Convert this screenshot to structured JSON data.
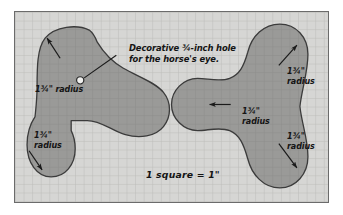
{
  "figure": {
    "background_color": "#d6d6d4",
    "grid_line_color": "#bdbdba",
    "shape_fill_color": "#999997",
    "shape_stroke_color": "#3a3a3a",
    "border_color": "#6b6b6b",
    "text_color": "#141414"
  },
  "labels": {
    "note": "Decorative ¾-inch hole for the horse's eye.",
    "note_line1": "Decorative ¾-inch hole",
    "note_line2": "for the horse's eye.",
    "left_top_radius": "1¾\" radius",
    "left_bottom_radius_line1": "1¾\"",
    "left_bottom_radius_line2": "radius",
    "middle_radius_line1": "1¾\"",
    "middle_radius_line2": "radius",
    "right_top_radius_line1": "1¾\"",
    "right_top_radius_line2": "radius",
    "right_bottom_radius_line1": "1¾\"",
    "right_bottom_radius_line2": "radius",
    "scale": "1 square = 1\""
  },
  "measurements": {
    "radius_value": "1¾\"",
    "hole_diameter": "¾-inch",
    "grid_square": "1\""
  },
  "shapes": [
    {
      "name": "horse-head-template",
      "position": "left",
      "callouts": [
        "left_top_radius",
        "left_bottom_radius"
      ],
      "features": [
        "eye-hole"
      ]
    },
    {
      "name": "trefoil-template",
      "position": "right",
      "callouts": [
        "middle_radius",
        "right_top_radius",
        "right_bottom_radius"
      ]
    }
  ]
}
